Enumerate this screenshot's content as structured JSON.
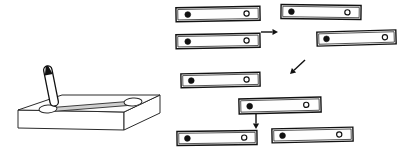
{
  "figure": {
    "title": "",
    "background_color": "#ffffff",
    "line_color": "#111111",
    "width": 397,
    "height": 156
  },
  "apparatus": {
    "name": "electrophoresis-tray",
    "label": "",
    "tray": {
      "top_face": "18,110 62,95 160,95 124,112",
      "front_face": "18,110 124,112 124,130 18,128",
      "right_face": "124,112 160,95 160,113 124,130",
      "fill_color": "#ffffff",
      "edge_color": "#2a2a2a"
    },
    "channel": {
      "name": "gel-channel",
      "points": "46,108 134,101 134,105 46,112",
      "fill_color": "#cfcfcf"
    },
    "wells": [
      {
        "name": "well-left",
        "cx": 48,
        "cy": 109,
        "rx": 9,
        "ry": 4,
        "rotate": -4
      },
      {
        "name": "well-right",
        "cx": 133,
        "cy": 102,
        "rx": 9,
        "ry": 4,
        "rotate": -4
      }
    ],
    "applicator": {
      "name": "applicator-stick",
      "description": "tilted elongated applicator above left well",
      "tip_x": 47,
      "tip_y": 106,
      "top_x": 55,
      "top_y": 66,
      "fill_color": "#ffffff",
      "stroke_color": "#111111"
    }
  },
  "strips": [
    {
      "name": "strip-1",
      "x": 176,
      "y": 7,
      "w": 84,
      "h": 14,
      "tilt": -1.0,
      "filled_dot_x": 0.14,
      "hollow_dot_x": 0.84
    },
    {
      "name": "strip-2",
      "x": 176,
      "y": 34,
      "w": 84,
      "h": 14,
      "tilt": -1.0,
      "filled_dot_x": 0.14,
      "hollow_dot_x": 0.84
    },
    {
      "name": "strip-3",
      "x": 281,
      "y": 5,
      "w": 80,
      "h": 14,
      "tilt": 0.8,
      "filled_dot_x": 0.13,
      "hollow_dot_x": 0.83
    },
    {
      "name": "strip-4",
      "x": 317,
      "y": 31,
      "w": 79,
      "h": 14,
      "tilt": -1.6,
      "filled_dot_x": 0.12,
      "hollow_dot_x": 0.86
    },
    {
      "name": "strip-5",
      "x": 181,
      "y": 73,
      "w": 79,
      "h": 14,
      "tilt": -1.2,
      "filled_dot_x": 0.13,
      "hollow_dot_x": 0.83
    },
    {
      "name": "strip-6",
      "x": 239,
      "y": 98,
      "w": 82,
      "h": 15,
      "tilt": -1.4,
      "filled_dot_x": 0.13,
      "hollow_dot_x": 0.82
    },
    {
      "name": "strip-7",
      "x": 177,
      "y": 131,
      "w": 80,
      "h": 14,
      "tilt": -0.8,
      "filled_dot_x": 0.13,
      "hollow_dot_x": 0.84
    },
    {
      "name": "strip-8",
      "x": 272,
      "y": 128,
      "w": 81,
      "h": 14,
      "tilt": -1.2,
      "filled_dot_x": 0.13,
      "hollow_dot_x": 0.83
    }
  ],
  "arrows": [
    {
      "name": "arrow-right",
      "direction": "right",
      "x1": 261,
      "y1": 32,
      "x2": 278,
      "y2": 32
    },
    {
      "name": "arrow-down-left",
      "direction": "down-left",
      "x1": 305,
      "y1": 60,
      "x2": 290,
      "y2": 74
    },
    {
      "name": "arrow-down",
      "direction": "down",
      "x1": 256,
      "y1": 114,
      "x2": 256,
      "y2": 129
    }
  ],
  "legend": {
    "filled_dot_meaning": "",
    "hollow_dot_meaning": ""
  }
}
